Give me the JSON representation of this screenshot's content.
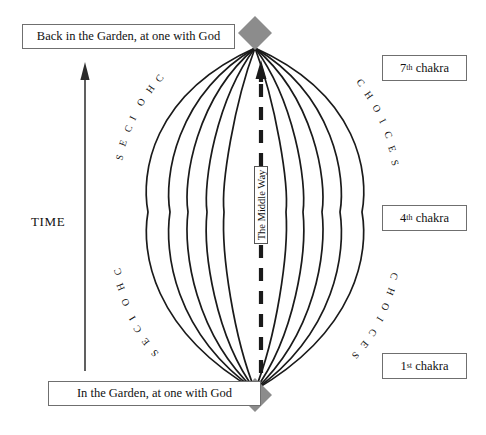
{
  "diagram": {
    "colors": {
      "line": "#1a1a1a",
      "diamond": "#8c8c8c",
      "box_border": "#6f6f6f",
      "text": "#111111",
      "background": "#ffffff"
    },
    "top_label": {
      "text": "Back in the Garden, at one with God"
    },
    "bottom_label": {
      "text": "In the Garden, at one with God"
    },
    "chakra_labels": [
      {
        "number": "7",
        "ordinal": "th",
        "word": "chakra"
      },
      {
        "number": "4",
        "ordinal": "th",
        "word": "chakra"
      },
      {
        "number": "1",
        "ordinal": "st",
        "word": "chakra"
      }
    ],
    "center_path_label": {
      "text": "The Middle Way",
      "orientation": "vertical-bottom-to-top"
    },
    "time_axis": {
      "label": "TIME",
      "direction": "upward"
    },
    "choices_labels": [
      {
        "position": "upper-left",
        "text": "CHOICES"
      },
      {
        "position": "lower-left",
        "text": "CHOICES"
      },
      {
        "position": "upper-right",
        "text": "CHOICES"
      },
      {
        "position": "lower-right",
        "text": "CHOICES"
      }
    ],
    "nodes": [
      {
        "name": "top-diamond",
        "shape": "diamond",
        "color": "#8c8c8c"
      },
      {
        "name": "bottom-diamond",
        "shape": "diamond",
        "color": "#8c8c8c"
      }
    ],
    "curve_count": 10
  }
}
